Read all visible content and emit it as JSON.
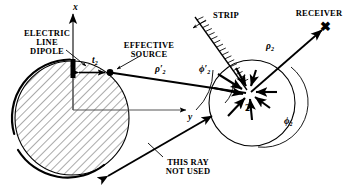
{
  "figure": {
    "background": "#ffffff",
    "ink": "#000000",
    "hatch_color": "#555555"
  },
  "labels": {
    "electric_line_dipole": "ELECTRIC\nLINE\nDIPOLE",
    "effective_source": "EFFECTIVE\nSOURCE",
    "strip": "STRIP",
    "receiver": "RECEIVER",
    "this_ray_not_used": "THIS RAY\nNOT USED",
    "receiver_marker": "✖"
  },
  "axes": {
    "x_label": "x",
    "y_label": "y"
  },
  "math_symbols": {
    "t2": "t",
    "t2_sub": "2",
    "rho2_prime": "ρ′",
    "rho2_prime_sub": "2",
    "rho2": "ρ",
    "rho2_sub": "2",
    "phi2_prime": "ϕ′",
    "phi2_prime_sub": "2",
    "phi2": "ϕ",
    "phi2_sub": "2",
    "point_label": "2"
  },
  "geometry": {
    "big_cylinder": {
      "cx": 72,
      "cy": 118,
      "r": 58,
      "hatched": true,
      "hatch_angle_deg": 45
    },
    "small_circle": {
      "cx": 252,
      "cy": 103,
      "r": 43
    },
    "dipole_bar": {
      "x": 71,
      "y": 60,
      "w": 5,
      "h": 18
    },
    "effective_source_dot": {
      "x": 110,
      "y": 73,
      "r": 3
    },
    "origin": {
      "x": 73,
      "y": 110
    },
    "receiver_point": {
      "x": 326,
      "y": 26
    },
    "scatter_point": {
      "x": 252,
      "y": 92
    },
    "strip_line": {
      "x1": 196,
      "y1": 18,
      "x2": 246,
      "y2": 88,
      "hatch_side": "right"
    },
    "ray_not_used": {
      "x1": 110,
      "y1": 175,
      "x2": 206,
      "y2": 118
    },
    "arrow_star_count": 8
  }
}
